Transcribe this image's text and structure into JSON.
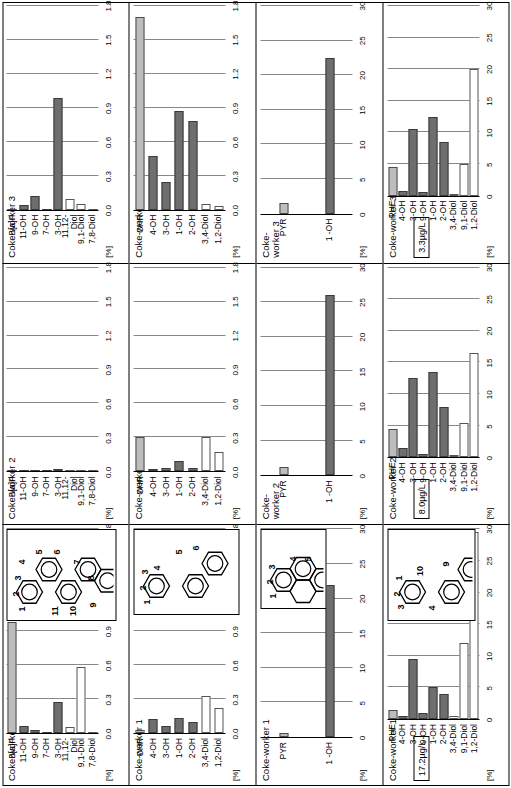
{
  "figure": {
    "rotation": "90deg-ccw",
    "units_label": "[%]",
    "colors": {
      "bar_filled": "#6e6e6e",
      "bar_hollow": "#ffffff",
      "bar_light": "#bdbdbd",
      "axis": "#000000",
      "gridline": "#888888"
    }
  },
  "chart_data": [
    {
      "id": "bap-worker1",
      "type": "bar",
      "orientation": "horizontal",
      "group": "B[a]P",
      "title": "Coke-worker 1",
      "ylabel": "[%]",
      "xlim": [
        0.0,
        1.8
      ],
      "xticks": [
        "0.0",
        "0.3",
        "0.6",
        "0.9",
        "1.2",
        "1.5",
        "1.8"
      ],
      "grid": true,
      "categories": [
        "B[a]P",
        "11-OH",
        "9-OH",
        "7-OH",
        "3-OH",
        "11,12-Diol",
        "9,1-Diol",
        "7,8-Diol"
      ],
      "values": [
        0.98,
        0.06,
        0.03,
        0.0,
        0.27,
        0.05,
        0.58,
        0.0
      ],
      "styles": [
        "light",
        "filled",
        "filled",
        "filled",
        "filled",
        "hollow",
        "hollow",
        "hollow"
      ]
    },
    {
      "id": "bap-worker2",
      "type": "bar",
      "orientation": "horizontal",
      "group": "B[a]P",
      "title": "Coke-worker 2",
      "ylabel": "[%]",
      "xlim": [
        0.0,
        1.8
      ],
      "xticks": [
        "0.0",
        "0.3",
        "0.6",
        "0.9",
        "1.2",
        "1.5",
        "1.8"
      ],
      "grid": true,
      "categories": [
        "B[a]P",
        "11-OH",
        "9-OH",
        "7-OH",
        "3-OH",
        "11,12-Diol",
        "9,1-Diol",
        "7,8-Diol"
      ],
      "values": [
        0.0,
        0.0,
        0.0,
        0.0,
        0.02,
        0.0,
        0.0,
        0.0
      ],
      "styles": [
        "light",
        "filled",
        "filled",
        "filled",
        "filled",
        "hollow",
        "hollow",
        "hollow"
      ]
    },
    {
      "id": "bap-worker3",
      "type": "bar",
      "orientation": "horizontal",
      "group": "B[a]P",
      "title": "Coke-worker 3",
      "ylabel": "[%]",
      "xlim": [
        0.0,
        1.8
      ],
      "xticks": [
        "0.0",
        "0.3",
        "0.6",
        "0.9",
        "1.2",
        "1.5",
        "1.8"
      ],
      "grid": true,
      "categories": [
        "B[a]P",
        "11-OH",
        "9-OH",
        "7-OH",
        "3-OH",
        "11,12-Diol",
        "9,1-Diol",
        "7,8-Diol"
      ],
      "values": [
        0.0,
        0.04,
        0.12,
        0.0,
        0.99,
        0.09,
        0.05,
        0.0
      ],
      "styles": [
        "light",
        "filled",
        "filled",
        "filled",
        "filled",
        "hollow",
        "hollow",
        "hollow"
      ]
    },
    {
      "id": "chr-worker1",
      "type": "bar",
      "orientation": "horizontal",
      "group": "CHR",
      "title": "Coke-worker 1",
      "ylabel": "[%]",
      "xlim": [
        0.0,
        1.8
      ],
      "xticks": [
        "0.0",
        "0.3",
        "0.6",
        "0.9",
        "1.2",
        "1.5",
        "1.8"
      ],
      "grid": true,
      "categories": [
        "CHR",
        "4-OH",
        "3-OH",
        "1-OH",
        "2-OH",
        "3,4-Diol",
        "1,2-Diol"
      ],
      "values": [
        0.03,
        0.12,
        0.06,
        0.13,
        0.1,
        0.33,
        0.22
      ],
      "styles": [
        "light",
        "filled",
        "filled",
        "filled",
        "filled",
        "hollow",
        "hollow"
      ]
    },
    {
      "id": "chr-worker2",
      "type": "bar",
      "orientation": "horizontal",
      "group": "CHR",
      "title": "Coke-worker 2",
      "ylabel": "[%]",
      "xlim": [
        0.0,
        1.8
      ],
      "xticks": [
        "0.0",
        "0.3",
        "0.6",
        "0.9",
        "1.2",
        "1.5",
        "1.8"
      ],
      "grid": true,
      "categories": [
        "CHR",
        "4-OH",
        "3-OH",
        "1-OH",
        "2-OH",
        "3,4-Diol",
        "1,2-Diol"
      ],
      "values": [
        0.3,
        0.02,
        0.03,
        0.09,
        0.03,
        0.3,
        0.17
      ],
      "styles": [
        "light",
        "filled",
        "filled",
        "filled",
        "filled",
        "hollow",
        "hollow"
      ]
    },
    {
      "id": "chr-worker3",
      "type": "bar",
      "orientation": "horizontal",
      "group": "CHR",
      "title": "Coke-worker 3",
      "ylabel": "[%]",
      "xlim": [
        0.0,
        1.8
      ],
      "xticks": [
        "0.0",
        "0.3",
        "0.6",
        "0.9",
        "1.2",
        "1.5",
        "1.8"
      ],
      "grid": true,
      "categories": [
        "CHR",
        "4-OH",
        "3-OH",
        "1-OH",
        "2-OH",
        "3,4-Diol",
        "1,2-Diol"
      ],
      "values": [
        1.7,
        0.47,
        0.24,
        0.87,
        0.78,
        0.05,
        0.03
      ],
      "styles": [
        "light",
        "filled",
        "filled",
        "filled",
        "filled",
        "hollow",
        "hollow"
      ]
    },
    {
      "id": "pyr-worker1",
      "type": "bar",
      "orientation": "horizontal",
      "group": "PYR",
      "title": "Coke-worker 1",
      "ylabel": "[%]",
      "xlim": [
        0,
        30
      ],
      "xticks": [
        "0",
        "5",
        "10",
        "15",
        "20",
        "25",
        "30"
      ],
      "grid": true,
      "categories": [
        "PYR",
        "1 -OH"
      ],
      "values": [
        0.6,
        22.0
      ],
      "styles": [
        "light",
        "filled"
      ]
    },
    {
      "id": "pyr-worker2",
      "type": "bar",
      "orientation": "horizontal",
      "group": "PYR",
      "title": "Coke-\nworker 2",
      "ylabel": "[%]",
      "xlim": [
        0,
        30
      ],
      "xticks": [
        "0",
        "5",
        "10",
        "15",
        "20",
        "25",
        "30"
      ],
      "grid": true,
      "categories": [
        "PYR",
        "1 -OH"
      ],
      "values": [
        1.2,
        26.0
      ],
      "styles": [
        "light",
        "filled"
      ]
    },
    {
      "id": "pyr-worker3",
      "type": "bar",
      "orientation": "horizontal",
      "group": "PYR",
      "title": "Coke-\nworker 3",
      "ylabel": "[%]",
      "xlim": [
        0,
        30
      ],
      "xticks": [
        "0",
        "5",
        "10",
        "15",
        "20",
        "25",
        "30"
      ],
      "grid": true,
      "categories": [
        "PYR",
        "1 -OH"
      ],
      "values": [
        1.6,
        22.5
      ],
      "styles": [
        "light",
        "filled"
      ]
    },
    {
      "id": "phe-worker1",
      "type": "bar",
      "orientation": "horizontal",
      "group": "PHE",
      "title": "Coke-worker 1",
      "concentration": "17.2µg/L",
      "ylabel": "[%]",
      "xlim": [
        0,
        30
      ],
      "xticks": [
        "0",
        "5",
        "10",
        "15",
        "20",
        "25",
        "30"
      ],
      "grid": true,
      "categories": [
        "PHE",
        "4-OH",
        "3-OH",
        "9-OH",
        "1-OH",
        "2-OH",
        "3,4-Diol",
        "9,1-Diol",
        "1,2-Diol"
      ],
      "values": [
        1.5,
        0.4,
        9.5,
        1.0,
        5.0,
        4.0,
        0.4,
        12.0,
        29.5
      ],
      "styles": [
        "light",
        "filled",
        "filled",
        "filled",
        "filled",
        "filled",
        "hollow",
        "hollow",
        "hollow"
      ]
    },
    {
      "id": "phe-worker2",
      "type": "bar",
      "orientation": "horizontal",
      "group": "PHE",
      "title": "Coke-worker 2",
      "concentration": "8.0µg/L",
      "ylabel": "[%]",
      "xlim": [
        0,
        30
      ],
      "xticks": [
        "0",
        "5",
        "10",
        "15",
        "20",
        "25",
        "30"
      ],
      "grid": true,
      "categories": [
        "PHE",
        "4-OH",
        "3-OH",
        "9-OH",
        "1-OH",
        "2-OH",
        "3,4-Diol",
        "9,1-Diol",
        "1,2-Diol"
      ],
      "values": [
        4.5,
        1.5,
        12.5,
        0.6,
        13.5,
        8.0,
        0.3,
        5.5,
        16.5
      ],
      "styles": [
        "light",
        "filled",
        "filled",
        "filled",
        "filled",
        "filled",
        "hollow",
        "hollow",
        "hollow"
      ]
    },
    {
      "id": "phe-worker3",
      "type": "bar",
      "orientation": "horizontal",
      "group": "PHE",
      "title": "Coke-worker 3",
      "concentration": "3.3µg/L",
      "ylabel": "[%]",
      "xlim": [
        0,
        30
      ],
      "xticks": [
        "0",
        "5",
        "10",
        "15",
        "20",
        "25",
        "30"
      ],
      "grid": true,
      "categories": [
        "PHE",
        "4-OH",
        "3-OH",
        "9-OH",
        "1-OH",
        "2-OH",
        "3,4-Diol",
        "9,1-Diol",
        "1,2-Diol"
      ],
      "values": [
        4.5,
        0.7,
        10.5,
        0.5,
        12.5,
        8.5,
        0.3,
        5.0,
        20.0
      ],
      "styles": [
        "light",
        "filled",
        "filled",
        "filled",
        "filled",
        "filled",
        "hollow",
        "hollow",
        "hollow"
      ]
    }
  ],
  "insets": [
    {
      "id": "inset-bap",
      "name": "benzo[a]pyrene-structure",
      "ring_count": 5,
      "position_numbers": [
        "1",
        "2",
        "3",
        "4",
        "5",
        "6",
        "7",
        "8",
        "9",
        "10",
        "11"
      ]
    },
    {
      "id": "inset-chr",
      "name": "chrysene-structure",
      "ring_count": 4,
      "position_numbers": [
        "1",
        "2",
        "3",
        "4",
        "5",
        "6"
      ]
    },
    {
      "id": "inset-pyr",
      "name": "pyrene-structure",
      "ring_count": 4,
      "position_numbers": [
        "1",
        "2",
        "3",
        "4",
        "5"
      ]
    },
    {
      "id": "inset-phe",
      "name": "phenanthrene-structure",
      "ring_count": 3,
      "position_numbers": [
        "1",
        "2",
        "3",
        "4",
        "9",
        "10"
      ]
    }
  ]
}
